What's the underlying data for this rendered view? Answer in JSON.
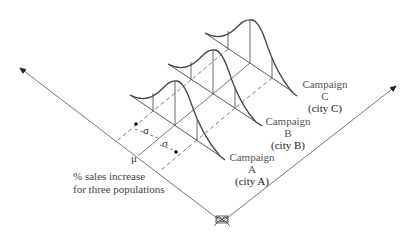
{
  "figure": {
    "type": "diagram",
    "axis_caption_line1": "% sales increase",
    "axis_caption_line2": "for three populations",
    "mean_symbol": "μ",
    "sd_symbol_1": "σ",
    "sd_symbol_2": "σ",
    "origin_symbol": "⌀"
  },
  "campaigns": [
    {
      "name": "Campaign",
      "letter": "A",
      "city": "(city A)"
    },
    {
      "name": "Campaign",
      "letter": "B",
      "city": "(city B)"
    },
    {
      "name": "Campaign",
      "letter": "C",
      "city": "(city C)"
    }
  ],
  "colors": {
    "line": "#555555",
    "curve": "#444444",
    "text": "#555555",
    "background": "#ffffff"
  }
}
